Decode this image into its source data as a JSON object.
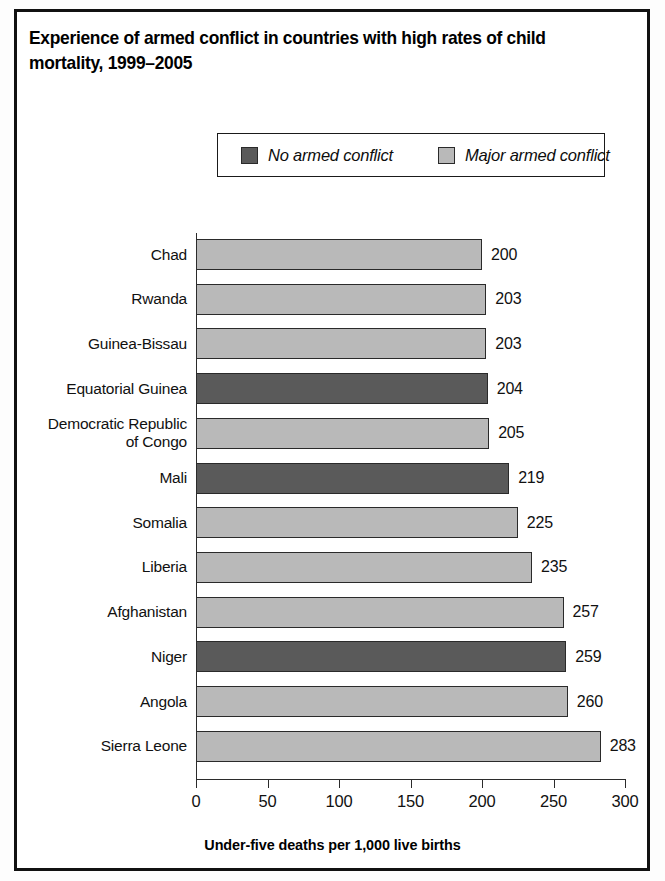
{
  "figure": {
    "title": "Experience of armed conflict in countries with high rates of child mortality, 1999–2005"
  },
  "legend": {
    "items": [
      {
        "label": "No armed conflict",
        "color": "#5a5a5a",
        "key": "no_conflict"
      },
      {
        "label": "Major armed conflict",
        "color": "#b9b9b9",
        "key": "major_conflict"
      }
    ]
  },
  "axis": {
    "x_title": "Under-five deaths per 1,000 live births",
    "ticks": [
      "0",
      "50",
      "100",
      "150",
      "200",
      "250",
      "300"
    ]
  },
  "chart_data": {
    "type": "bar",
    "orientation": "horizontal",
    "title": "Experience of armed conflict in countries with high rates of child mortality, 1999–2005",
    "xlabel": "Under-five deaths per 1,000 live births",
    "ylabel": "",
    "xlim": [
      0,
      300
    ],
    "xticks": [
      0,
      50,
      100,
      150,
      200,
      250,
      300
    ],
    "grid": false,
    "legend_position": "top-center",
    "categories": [
      "Chad",
      "Rwanda",
      "Guinea-Bissau",
      "Equatorial Guinea",
      "Democratic Republic of Congo",
      "Mali",
      "Somalia",
      "Liberia",
      "Afghanistan",
      "Niger",
      "Angola",
      "Sierra Leone"
    ],
    "values": [
      200,
      203,
      203,
      204,
      205,
      219,
      225,
      235,
      257,
      259,
      260,
      283
    ],
    "groups": [
      "major_conflict",
      "major_conflict",
      "major_conflict",
      "no_conflict",
      "major_conflict",
      "no_conflict",
      "major_conflict",
      "major_conflict",
      "major_conflict",
      "no_conflict",
      "major_conflict",
      "major_conflict"
    ],
    "series": [
      {
        "name": "No armed conflict",
        "color": "#5a5a5a",
        "points": [
          {
            "category": "Equatorial Guinea",
            "value": 204
          },
          {
            "category": "Mali",
            "value": 219
          },
          {
            "category": "Niger",
            "value": 259
          }
        ]
      },
      {
        "name": "Major armed conflict",
        "color": "#b9b9b9",
        "points": [
          {
            "category": "Chad",
            "value": 200
          },
          {
            "category": "Rwanda",
            "value": 203
          },
          {
            "category": "Guinea-Bissau",
            "value": 203
          },
          {
            "category": "Democratic Republic of Congo",
            "value": 205
          },
          {
            "category": "Somalia",
            "value": 225
          },
          {
            "category": "Liberia",
            "value": 235
          },
          {
            "category": "Afghanistan",
            "value": 257
          },
          {
            "category": "Niger",
            "value": 0
          },
          {
            "category": "Angola",
            "value": 260
          },
          {
            "category": "Sierra Leone",
            "value": 283
          }
        ]
      }
    ],
    "bar_labels": [
      "200",
      "203",
      "203",
      "204",
      "205",
      "219",
      "225",
      "235",
      "257",
      "259",
      "260",
      "283"
    ],
    "category_labels_wrapped": [
      "Chad",
      "Rwanda",
      "Guinea-Bissau",
      "Equatorial Guinea",
      "Democratic Republic\nof Congo",
      "Mali",
      "Somalia",
      "Liberia",
      "Afghanistan",
      "Niger",
      "Angola",
      "Sierra Leone"
    ]
  }
}
